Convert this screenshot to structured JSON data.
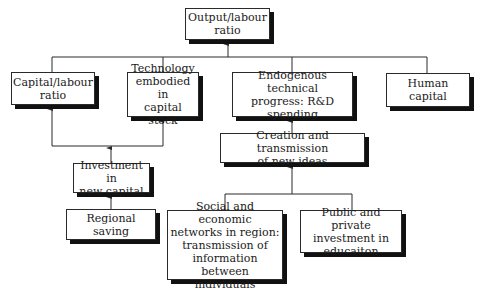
{
  "diagram": {
    "type": "flowchart",
    "nodes": {
      "output": "Output/labour\nratio",
      "capital": "Capital/labour\nratio",
      "technology": "Technology\nembodied in\ncapital stock",
      "endogenous": "Endogenous technical\nprogress: R&D\nspending",
      "human": "Human capital",
      "creation": "Creation and transmission\nof new ideas",
      "investment": "Investment in\nnew capital",
      "saving": "Regional saving",
      "social": "Social and economic\nnetworks in region:\ntransmission of\ninformation between\nindividuals",
      "public": "Public and private\ninvestment in\neducaiton"
    },
    "edges": [
      {
        "from": "capital",
        "to": "output"
      },
      {
        "from": "technology",
        "to": "output"
      },
      {
        "from": "endogenous",
        "to": "output"
      },
      {
        "from": "human",
        "to": "output"
      },
      {
        "from": "investment",
        "to": "capital"
      },
      {
        "from": "investment",
        "to": "technology"
      },
      {
        "from": "saving",
        "to": "investment"
      },
      {
        "from": "creation",
        "to": "endogenous"
      },
      {
        "from": "social",
        "to": "creation"
      },
      {
        "from": "public",
        "to": "creation"
      }
    ],
    "colors": {
      "line": "#2a2a2a",
      "shadow": "#111111",
      "background": "#ffffff"
    }
  }
}
